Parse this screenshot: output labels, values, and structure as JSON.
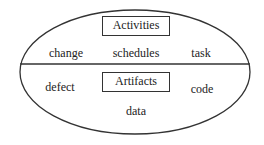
{
  "diagram": {
    "type": "ellipse-split",
    "stroke_color": "#333333",
    "text_color": "#222222",
    "upper": {
      "title": "Activities",
      "items": [
        "change",
        "schedules",
        "task"
      ]
    },
    "lower": {
      "title": "Artifacts",
      "items": [
        "defect",
        "code",
        "data"
      ]
    }
  }
}
